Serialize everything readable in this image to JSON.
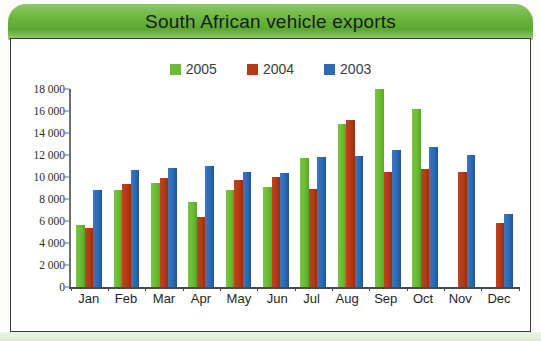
{
  "banner": {
    "title": "South African vehicle exports",
    "background_color": "#6fb842"
  },
  "caption": {
    "text": "                                                                                                     "
  },
  "legend": {
    "position": "top-center",
    "items": [
      {
        "label": "2005",
        "color": "#6cbb33",
        "swatch": "legend-swatch-2005"
      },
      {
        "label": "2004",
        "color": "#b33a19",
        "swatch": "legend-swatch-2004"
      },
      {
        "label": "2003",
        "color": "#2b6ab4",
        "swatch": "legend-swatch-2003"
      }
    ]
  },
  "axis": {
    "y_tick_labels": [
      "18 000",
      "16 000",
      "14 000",
      "12 000",
      "10 000",
      "8 000",
      "6 000",
      "4 000",
      "2 000",
      "0"
    ],
    "y_tick_values": [
      18000,
      16000,
      14000,
      12000,
      10000,
      8000,
      6000,
      4000,
      2000,
      0
    ]
  },
  "chart_data": {
    "type": "bar",
    "title": "South African vehicle exports",
    "xlabel": "",
    "ylabel": "",
    "ylim": [
      0,
      18000
    ],
    "ytick_step": 2000,
    "grid": false,
    "legend_position": "top-center",
    "categories": [
      "Jan",
      "Feb",
      "Mar",
      "Apr",
      "May",
      "Jun",
      "Jul",
      "Aug",
      "Sep",
      "Oct",
      "Nov",
      "Dec"
    ],
    "series": [
      {
        "name": "2005",
        "color": "#6cbb33",
        "values": [
          5600,
          8800,
          9500,
          7700,
          8800,
          9100,
          11700,
          14800,
          18000,
          16200,
          null,
          null
        ]
      },
      {
        "name": "2004",
        "color": "#b33a19",
        "values": [
          5400,
          9400,
          9900,
          6400,
          9700,
          10000,
          8900,
          15200,
          10500,
          10700,
          10500,
          5800
        ]
      },
      {
        "name": "2003",
        "color": "#2b6ab4",
        "values": [
          8800,
          10600,
          10800,
          11000,
          10500,
          10400,
          11800,
          11900,
          12500,
          12700,
          12000,
          6600
        ]
      }
    ]
  }
}
